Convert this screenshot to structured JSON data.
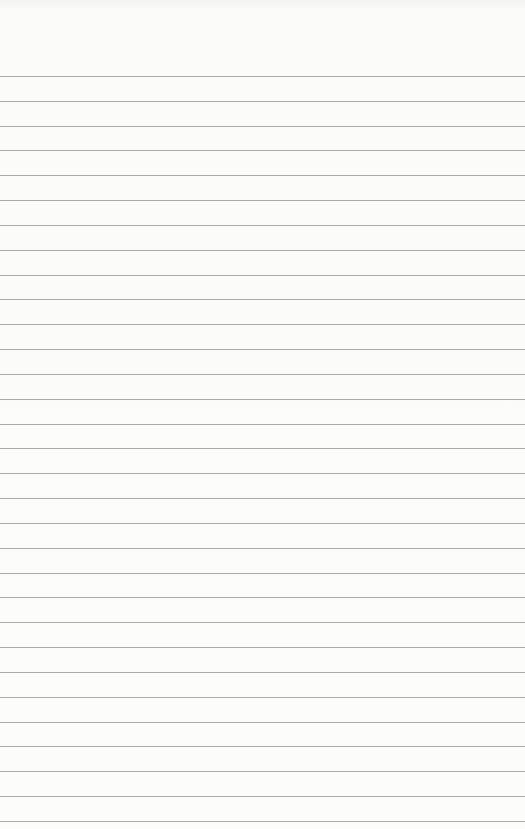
{
  "page": {
    "type": "lined-paper",
    "background_color": "#fbfbfa",
    "rule_color": "#9b9b9b",
    "first_rule_y": 76,
    "rule_spacing": 24.83,
    "rule_count": 31,
    "content": ""
  }
}
